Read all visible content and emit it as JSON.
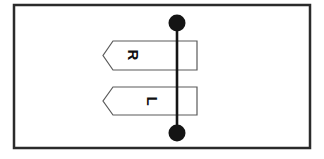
{
  "figure": {
    "background_color": "#ffffff",
    "frame": {
      "name": "outer-border",
      "x": 14,
      "y": 5,
      "width": 296,
      "height": 143,
      "stroke_color": "#2b2b2b",
      "stroke_width": 2.5,
      "fill": "none"
    },
    "banners": [
      {
        "id": "upper-banner",
        "label": "R",
        "label_rotation_deg": 90,
        "label_x": 133,
        "label_y": 55,
        "points": "197,41 113,41 103,55.5 113,70 197,70",
        "stroke_color": "#5a5a5a",
        "stroke_width": 1.2,
        "fill": "#ffffff"
      },
      {
        "id": "lower-banner",
        "label": "L",
        "label_rotation_deg": 90,
        "label_x": 152,
        "label_y": 101,
        "points": "197,87 113,87 103,101 113,115 197,115",
        "stroke_color": "#5a5a5a",
        "stroke_width": 1.2,
        "fill": "#ffffff"
      }
    ],
    "axis_line": {
      "id": "vertical-axis-line",
      "x1": 177,
      "y1": 23,
      "x2": 177,
      "y2": 133,
      "stroke_color": "#141414",
      "stroke_width": 2.6
    },
    "nodes": [
      {
        "id": "top-node",
        "cx": 177,
        "cy": 23,
        "r": 8.5,
        "fill": "#141414"
      },
      {
        "id": "bottom-node",
        "cx": 177,
        "cy": 133,
        "r": 8.5,
        "fill": "#141414"
      }
    ]
  }
}
